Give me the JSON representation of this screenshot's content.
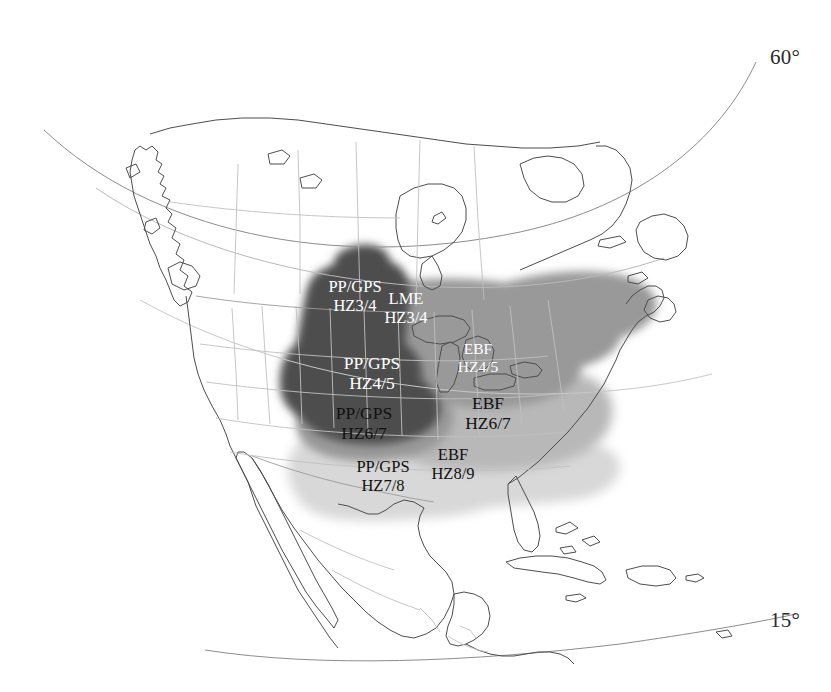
{
  "figure": {
    "type": "map",
    "projection": "conic",
    "background_color": "#ffffff",
    "outline_color": "#4d4d4d",
    "border_color": "#b4b4b4"
  },
  "graticule": {
    "labels": [
      {
        "name": "latitude-60",
        "text": "60°",
        "x": 770,
        "y": 45
      },
      {
        "name": "latitude-15",
        "text": "15°",
        "x": 770,
        "y": 608
      }
    ]
  },
  "legend_tones": {
    "dark_gray": "#4d4d4d",
    "mid_gray": "#999999",
    "mid_light_gray": "#b8b8b8",
    "light_gray": "#d8d8d8",
    "pale_gray": "#e6e6e6"
  },
  "regions": [
    {
      "name": "region-pp-gps-hz3-4",
      "code": "PP/GPS",
      "zone": "HZ3/4",
      "line1": "PP/GPS",
      "line2": "HZ3/4",
      "tone": "dark_gray",
      "text_color": "light",
      "label_x": 355,
      "label_y": 296,
      "font_size": "fs16"
    },
    {
      "name": "region-lme-hz3-4",
      "code": "LME",
      "zone": "HZ3/4",
      "line1": "LME",
      "line2": "HZ3/4",
      "tone": "mid_gray",
      "text_color": "light",
      "label_x": 406,
      "label_y": 308,
      "font_size": "fs16"
    },
    {
      "name": "region-ebf-hz4-5",
      "code": "EBF",
      "zone": "HZ4/5",
      "line1": "EBF",
      "line2": "HZ4/5",
      "tone": "mid_gray",
      "text_color": "light",
      "label_x": 478,
      "label_y": 358,
      "font_size": "fs15"
    },
    {
      "name": "region-pp-gps-hz4-5",
      "code": "PP/GPS",
      "zone": "HZ4/5",
      "line1": "PP/GPS",
      "line2": "HZ4/5",
      "tone": "dark_gray",
      "text_color": "light",
      "label_x": 372,
      "label_y": 373,
      "font_size": "fs17"
    },
    {
      "name": "region-pp-gps-hz6-7",
      "code": "PP/GPS",
      "zone": "HZ6/7",
      "line1": "PP/GPS",
      "line2": "HZ6/7",
      "tone": "mid_gray",
      "text_color": "dark",
      "label_x": 364,
      "label_y": 423,
      "font_size": "fs17"
    },
    {
      "name": "region-ebf-hz6-7",
      "code": "EBF",
      "zone": "HZ6/7",
      "line1": "EBF",
      "line2": "HZ6/7",
      "tone": "mid_light_gray",
      "text_color": "dark",
      "label_x": 488,
      "label_y": 413,
      "font_size": "fs17"
    },
    {
      "name": "region-pp-gps-hz7-8",
      "code": "PP/GPS",
      "zone": "HZ7/8",
      "line1": "PP/GPS",
      "line2": "HZ7/8",
      "tone": "light_gray",
      "text_color": "dark",
      "label_x": 383,
      "label_y": 476,
      "font_size": "fs16"
    },
    {
      "name": "region-ebf-hz8-9",
      "code": "EBF",
      "zone": "HZ8/9",
      "line1": "EBF",
      "line2": "HZ8/9",
      "tone": "light_gray",
      "text_color": "dark",
      "label_x": 453,
      "label_y": 464,
      "font_size": "fs16"
    }
  ]
}
